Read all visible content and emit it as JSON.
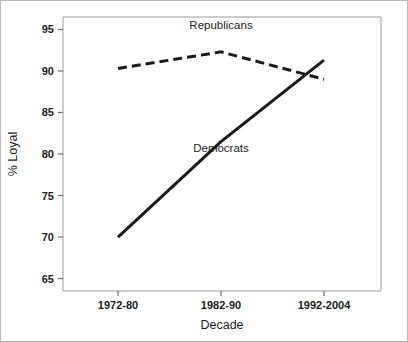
{
  "chart_data": {
    "type": "line",
    "title": "",
    "xlabel": "Decade",
    "ylabel": "% Loyal",
    "categories": [
      "1972-80",
      "1982-90",
      "1992-2004"
    ],
    "series": [
      {
        "name": "Republicans",
        "values": [
          90.3,
          92.3,
          89.0
        ],
        "style": "dashed",
        "color": "#1a1a1a"
      },
      {
        "name": "Democrats",
        "values": [
          70.0,
          81.5,
          91.3
        ],
        "style": "solid",
        "color": "#1a1a1a"
      }
    ],
    "ylim": [
      63.5,
      96.5
    ],
    "yticks": [
      65,
      70,
      75,
      80,
      85,
      90,
      95
    ],
    "ytick_labels": [
      "65",
      "70",
      "75",
      "80",
      "85",
      "90",
      "95"
    ],
    "grid": false,
    "legend_position": "inline-annotations",
    "annotations": [
      {
        "text": "Republicans",
        "x": "1982-90",
        "y": 95.0
      },
      {
        "text": "Democrats",
        "x": "1982-90",
        "y": 80.2
      }
    ]
  },
  "axes": {
    "y_title": "% Loyal",
    "x_title": "Decade"
  }
}
